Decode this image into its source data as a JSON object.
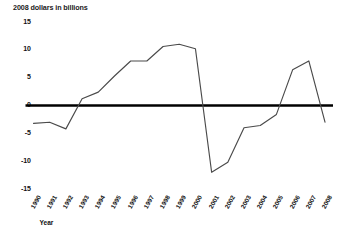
{
  "chart_data": {
    "type": "line",
    "title": "",
    "ylabel": "2008 dollars in billions",
    "xlabel": "Year",
    "ylim": [
      -15,
      15
    ],
    "yticks": [
      15,
      10,
      5,
      0,
      -5,
      -10,
      -15
    ],
    "ytick_labels": [
      "15",
      "10",
      "5",
      "0",
      "-5",
      "-10",
      "-15"
    ],
    "grid": false,
    "legend": "none",
    "zero_line": true,
    "zero_line_color": "#000000",
    "series_color": "#4a4a4a",
    "categories": [
      "1990",
      "1991",
      "1992",
      "1993",
      "1994",
      "1995",
      "1996",
      "1997",
      "1998",
      "1999",
      "2000",
      "2001",
      "2002",
      "2003",
      "2004",
      "2005",
      "2006",
      "2007",
      "2008"
    ],
    "series": [
      {
        "name": "2008 dollars in billions",
        "values": [
          -3.2,
          -3.0,
          -4.2,
          1.2,
          2.4,
          5.3,
          8.0,
          8.0,
          10.6,
          11.0,
          10.2,
          -12.0,
          -10.2,
          -4.0,
          -3.6,
          -1.6,
          6.4,
          8.0,
          -3.0
        ]
      }
    ]
  },
  "axis": {
    "ytitle": "2008 dollars in billions",
    "xtitle": "Year"
  }
}
